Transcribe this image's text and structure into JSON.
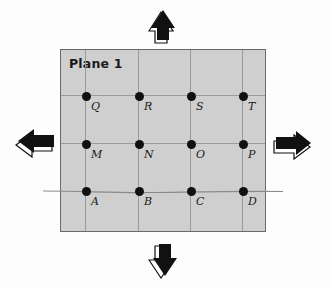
{
  "plane": {
    "title": "Plane 1",
    "background_color": "#cfcfcf",
    "grid_color": "#9a9a9a",
    "border_color": "#6a6a6a"
  },
  "grid": {
    "columns_x": [
      25,
      78,
      130,
      182
    ],
    "rows_y": [
      46,
      94,
      141
    ]
  },
  "points": [
    {
      "label": "Q",
      "row": 0,
      "col": 0
    },
    {
      "label": "R",
      "row": 0,
      "col": 1
    },
    {
      "label": "S",
      "row": 0,
      "col": 2
    },
    {
      "label": "T",
      "row": 0,
      "col": 3
    },
    {
      "label": "M",
      "row": 1,
      "col": 0
    },
    {
      "label": "N",
      "row": 1,
      "col": 1
    },
    {
      "label": "O",
      "row": 1,
      "col": 2
    },
    {
      "label": "P",
      "row": 1,
      "col": 3
    },
    {
      "label": "A",
      "row": 2,
      "col": 0
    },
    {
      "label": "B",
      "row": 2,
      "col": 1
    },
    {
      "label": "C",
      "row": 2,
      "col": 2
    },
    {
      "label": "D",
      "row": 2,
      "col": 3
    }
  ],
  "arrows": {
    "up": "arrow-up-icon",
    "down": "arrow-down-icon",
    "left": "arrow-left-icon",
    "right": "arrow-right-icon"
  }
}
